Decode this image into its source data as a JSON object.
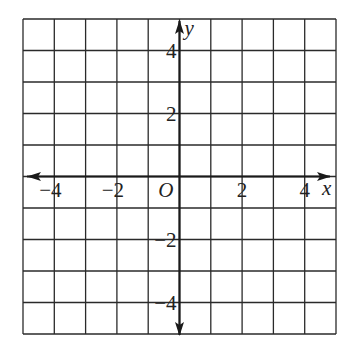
{
  "diagram": {
    "type": "coordinate-plane",
    "grid": {
      "x_min": -5,
      "x_max": 5,
      "y_min": -5,
      "y_max": 5,
      "step": 1,
      "line_color": "#2a2a2a"
    },
    "axes": {
      "x_label": "x",
      "y_label": "y",
      "origin_label": "O",
      "color": "#1a1a1a"
    },
    "x_ticks": [
      {
        "value": -4,
        "label": "−4"
      },
      {
        "value": -2,
        "label": "−2"
      },
      {
        "value": 2,
        "label": "2"
      },
      {
        "value": 4,
        "label": "4"
      }
    ],
    "y_ticks": [
      {
        "value": 4,
        "label": "4"
      },
      {
        "value": 2,
        "label": "2"
      },
      {
        "value": -2,
        "label": "−2"
      },
      {
        "value": -4,
        "label": "−4"
      }
    ]
  }
}
